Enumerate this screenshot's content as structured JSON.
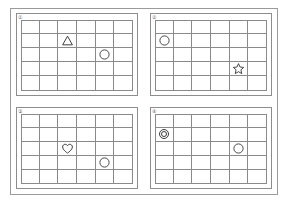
{
  "figure": {
    "grid": {
      "columns": 6,
      "rows": 5
    },
    "stroke_color": "#8a8a8a",
    "shape_color": "#3a3a3a",
    "background": "#ffffff"
  },
  "panels": [
    {
      "label": "①",
      "label_name": "panel-label-1",
      "shapes": [
        {
          "type": "triangle",
          "icon": "triangle-icon",
          "row": 2,
          "col": 3
        },
        {
          "type": "circle",
          "icon": "circle-icon",
          "row": 3,
          "col": 5
        }
      ]
    },
    {
      "label": "②",
      "label_name": "panel-label-2",
      "shapes": [
        {
          "type": "circle",
          "icon": "circle-icon",
          "row": 2,
          "col": 1
        },
        {
          "type": "star",
          "icon": "star-icon",
          "row": 4,
          "col": 5
        }
      ]
    },
    {
      "label": "③",
      "label_name": "panel-label-3",
      "shapes": [
        {
          "type": "heart",
          "icon": "heart-icon",
          "row": 3,
          "col": 3
        },
        {
          "type": "circle",
          "icon": "circle-icon",
          "row": 4,
          "col": 5
        }
      ]
    },
    {
      "label": "④",
      "label_name": "panel-label-4",
      "shapes": [
        {
          "type": "double-circle",
          "icon": "double-circle-icon",
          "row": 2,
          "col": 1
        },
        {
          "type": "circle",
          "icon": "circle-icon",
          "row": 3,
          "col": 5
        }
      ]
    }
  ]
}
